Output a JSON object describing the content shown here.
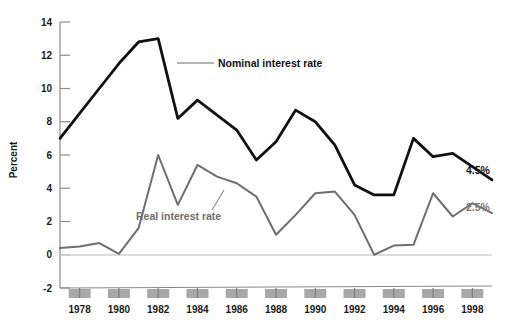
{
  "chart_data": {
    "type": "line",
    "title": "",
    "xlabel": "",
    "ylabel": "Percent",
    "ylim": [
      -2,
      14
    ],
    "xlim": [
      1977,
      1999
    ],
    "grid": false,
    "legend_position": "inline-annotations",
    "y_ticks": [
      "14",
      "12",
      "10",
      "8",
      "6",
      "4",
      "2",
      "0",
      "-2"
    ],
    "y_tick_values": [
      14,
      12,
      10,
      8,
      6,
      4,
      2,
      0,
      -2
    ],
    "x_tick_labels": [
      "1978",
      "1980",
      "1982",
      "1984",
      "1986",
      "1988",
      "1990",
      "1992",
      "1994",
      "1996",
      "1998"
    ],
    "x_tick_values": [
      1978,
      1980,
      1982,
      1984,
      1986,
      1988,
      1990,
      1992,
      1994,
      1996,
      1998
    ],
    "x": [
      1977,
      1978,
      1979,
      1980,
      1981,
      1982,
      1983,
      1984,
      1985,
      1986,
      1987,
      1988,
      1989,
      1990,
      1991,
      1992,
      1993,
      1994,
      1995,
      1996,
      1997,
      1998,
      1999
    ],
    "series": [
      {
        "name": "Nominal interest rate",
        "color": "#111111",
        "end_label": "4.5%",
        "values": [
          7.0,
          8.5,
          10.0,
          11.5,
          12.8,
          13.0,
          8.2,
          9.3,
          8.4,
          7.5,
          5.7,
          6.8,
          8.7,
          8.0,
          6.6,
          4.2,
          3.6,
          3.6,
          7.0,
          5.9,
          6.1,
          5.3,
          4.5
        ]
      },
      {
        "name": "Real interest rate",
        "color": "#6e6e6e",
        "end_label": "2.5%",
        "values": [
          0.4,
          0.5,
          0.7,
          0.05,
          1.6,
          6.0,
          3.0,
          5.4,
          4.7,
          4.3,
          3.5,
          1.2,
          2.4,
          3.7,
          3.8,
          2.4,
          0.0,
          0.55,
          0.6,
          3.7,
          2.3,
          3.1,
          2.5
        ]
      }
    ],
    "annotations": [
      {
        "text": "Nominal interest rate",
        "series": "Nominal interest rate"
      },
      {
        "text": "Real interest rate",
        "series": "Real interest rate"
      }
    ],
    "recession_bars": {
      "count": 11,
      "color": "#a8a8a8",
      "description": "gray tick blocks below axis at each labeled year"
    }
  }
}
